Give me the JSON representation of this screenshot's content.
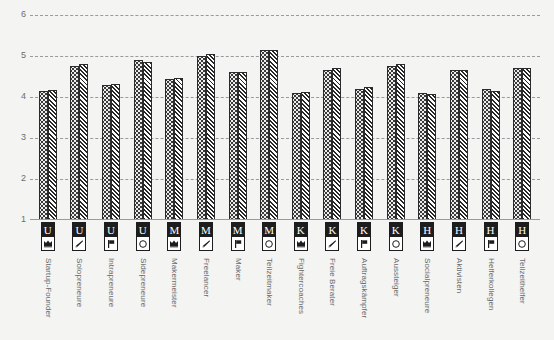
{
  "chart_data": {
    "type": "bar",
    "title": "",
    "xlabel": "",
    "ylabel": "",
    "ylim": [
      1,
      6
    ],
    "yticks": [
      "1",
      "2",
      "3",
      "4",
      "5",
      "6"
    ],
    "grid": true,
    "legend": "none",
    "categories": [
      "Startup-Founder",
      "Solopreneure",
      "Intrapreneure",
      "Sidepreneure",
      "Makermeister",
      "Freelancer",
      "Maker",
      "Teilzeitmaker",
      "Fightercoaches",
      "Freie Berater",
      "Auftragskämpfer",
      "Aussteiger",
      "Socialpreneure",
      "Aktivisten",
      "Helferkollegen",
      "Teilzeithelfer"
    ],
    "series": [
      {
        "name": "series-dotted",
        "pattern": "dots",
        "values": [
          4.15,
          4.75,
          4.3,
          4.9,
          4.45,
          5.0,
          4.6,
          5.15,
          4.1,
          4.65,
          4.2,
          4.75,
          4.1,
          4.65,
          4.2,
          4.7
        ]
      },
      {
        "name": "series-hatched",
        "pattern": "hatch",
        "values": [
          4.17,
          4.8,
          4.32,
          4.85,
          4.47,
          5.05,
          4.6,
          5.15,
          4.12,
          4.7,
          4.25,
          4.8,
          4.08,
          4.65,
          4.15,
          4.7
        ]
      }
    ],
    "icons": [
      {
        "letter": "U",
        "symbol": "crown"
      },
      {
        "letter": "U",
        "symbol": "pen"
      },
      {
        "letter": "U",
        "symbol": "flag"
      },
      {
        "letter": "U",
        "symbol": "circle"
      },
      {
        "letter": "M",
        "symbol": "crown"
      },
      {
        "letter": "M",
        "symbol": "pen"
      },
      {
        "letter": "M",
        "symbol": "flag"
      },
      {
        "letter": "M",
        "symbol": "circle"
      },
      {
        "letter": "K",
        "symbol": "crown"
      },
      {
        "letter": "K",
        "symbol": "pen"
      },
      {
        "letter": "K",
        "symbol": "flag"
      },
      {
        "letter": "K",
        "symbol": "circle"
      },
      {
        "letter": "H",
        "symbol": "crown"
      },
      {
        "letter": "H",
        "symbol": "pen"
      },
      {
        "letter": "H",
        "symbol": "flag"
      },
      {
        "letter": "H",
        "symbol": "circle"
      }
    ],
    "colors": {
      "background": "#f4f4f2",
      "gridline": "#9a9a9a",
      "bar_outline": "#2b2b2b",
      "tick_text": "#6d6d6d",
      "label_text": "#6a6a6a",
      "icon_box_fill": "#1d1d1d"
    }
  }
}
